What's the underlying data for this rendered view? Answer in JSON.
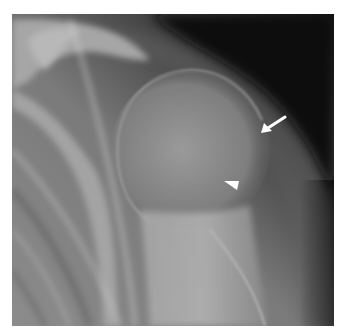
{
  "image": {
    "type": "radiograph",
    "view": "shoulder",
    "background_color": "#ffffff"
  },
  "annotations": {
    "arrow": {
      "icon": "arrow-icon",
      "color": "#ffffff",
      "tail": [
        285,
        117
      ],
      "tip": [
        261,
        133
      ]
    },
    "arrowhead": {
      "icon": "arrowhead-icon",
      "color": "#ffffff",
      "points": [
        [
          224,
          181
        ],
        [
          239,
          181
        ],
        [
          237,
          190
        ]
      ]
    }
  }
}
